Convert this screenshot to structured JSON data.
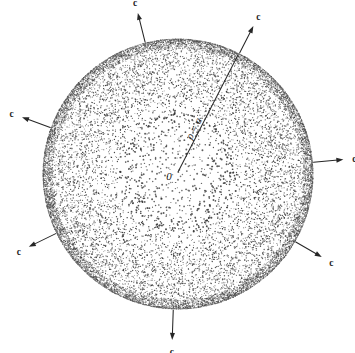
{
  "figure": {
    "background_color": "#ffffff",
    "ink_color": "#262626",
    "canvas": {
      "width": 355,
      "height": 353
    }
  },
  "sphere": {
    "name": "stippled-disk",
    "center_x": 178,
    "center_y": 174,
    "radius": 135,
    "stipple": {
      "dot_color": "#303030",
      "rim_color": "#4a4a4a",
      "center_density_note": "sparse at center, dense at rim"
    }
  },
  "origin": {
    "label": "0",
    "x": 178,
    "y": 172
  },
  "radius_marker": {
    "label": "ρ = a",
    "label_x": 197,
    "label_y": 130,
    "label_rotation_deg": -63,
    "from_x": 178,
    "from_y": 172,
    "to_x": 238,
    "to_y": 55
  },
  "arrows": [
    {
      "label": "c",
      "angle_deg": 104,
      "tail_r": 136,
      "length": 30,
      "label_gap": 11,
      "name": "arrow-c-top-left"
    },
    {
      "label": "c",
      "angle_deg": 63,
      "tail_r": 136,
      "length": 30,
      "label_gap": 11,
      "name": "arrow-c-top-right"
    },
    {
      "label": "c",
      "angle_deg": 160,
      "tail_r": 136,
      "length": 30,
      "label_gap": 11,
      "name": "arrow-c-left"
    },
    {
      "label": "c",
      "angle_deg": 5,
      "tail_r": 136,
      "length": 30,
      "label_gap": 11,
      "name": "arrow-c-right"
    },
    {
      "label": "c",
      "angle_deg": 206,
      "tail_r": 136,
      "length": 30,
      "label_gap": 11,
      "name": "arrow-c-bottom-left"
    },
    {
      "label": "c",
      "angle_deg": 330,
      "tail_r": 136,
      "length": 30,
      "label_gap": 11,
      "name": "arrow-c-bottom-right"
    },
    {
      "label": "c",
      "angle_deg": 268,
      "tail_r": 136,
      "length": 30,
      "label_gap": 12,
      "name": "arrow-c-bottom"
    }
  ]
}
